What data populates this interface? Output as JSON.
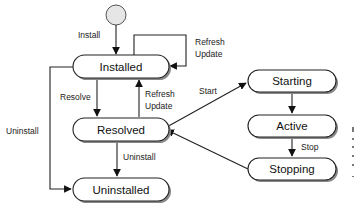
{
  "diagram": {
    "type": "state-machine",
    "initial_node": {
      "shape": "circle"
    },
    "states": [
      {
        "id": "installed",
        "label": "Installed"
      },
      {
        "id": "resolved",
        "label": "Resolved"
      },
      {
        "id": "uninstalled",
        "label": "Uninstalled"
      },
      {
        "id": "starting",
        "label": "Starting"
      },
      {
        "id": "active",
        "label": "Active"
      },
      {
        "id": "stopping",
        "label": "Stopping"
      }
    ],
    "transitions": [
      {
        "from": "initial",
        "to": "installed",
        "label": "Install"
      },
      {
        "from": "installed",
        "to": "installed",
        "label_line1": "Refresh",
        "label_line2": "Update"
      },
      {
        "from": "installed",
        "to": "resolved",
        "label": "Resolve"
      },
      {
        "from": "resolved",
        "to": "installed",
        "label_line1": "Refresh",
        "label_line2": "Update"
      },
      {
        "from": "installed",
        "to": "uninstalled",
        "label": "Uninstall"
      },
      {
        "from": "resolved",
        "to": "uninstalled",
        "label": "Uninstall"
      },
      {
        "from": "resolved",
        "to": "starting",
        "label": "Start"
      },
      {
        "from": "starting",
        "to": "active",
        "label": ""
      },
      {
        "from": "active",
        "to": "stopping",
        "label": "Stop"
      },
      {
        "from": "stopping",
        "to": "resolved",
        "label": ""
      }
    ]
  }
}
